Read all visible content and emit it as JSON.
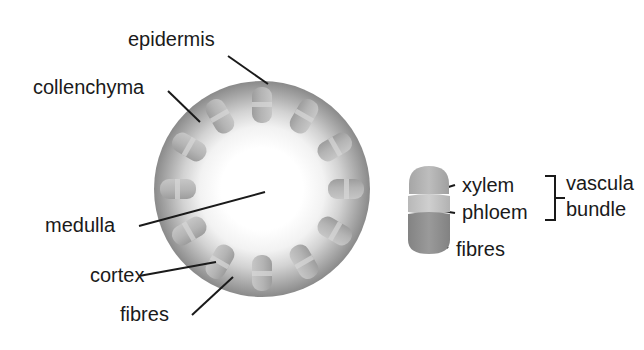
{
  "diagram": {
    "background_color": "#ffffff",
    "text_color": "#1a1a1a",
    "line_color": "#1a1a1a"
  },
  "stem": {
    "name": "stem-cross-section",
    "center_x": 262,
    "center_y": 189,
    "radius": 108,
    "rim_color": "#8a8a8a",
    "mid_color": "#bdbdbd",
    "core_color": "#ffffff",
    "bundle_count": 12,
    "bundle_ring_radius": 84,
    "bundle_color_outer": "#a9a9a9",
    "bundle_color_inner": "#c2c2c2",
    "bundles": [
      {
        "angle": -90,
        "label": "bundle-1"
      },
      {
        "angle": -60,
        "label": "bundle-2"
      },
      {
        "angle": -30,
        "label": "bundle-3"
      },
      {
        "angle": 0,
        "label": "bundle-4"
      },
      {
        "angle": 30,
        "label": "bundle-5"
      },
      {
        "angle": 60,
        "label": "bundle-6"
      },
      {
        "angle": 90,
        "label": "bundle-7"
      },
      {
        "angle": 120,
        "label": "bundle-8"
      },
      {
        "angle": 150,
        "label": "bundle-9"
      },
      {
        "angle": 180,
        "label": "bundle-10"
      },
      {
        "angle": 210,
        "label": "bundle-11"
      },
      {
        "angle": 240,
        "label": "bundle-12"
      }
    ]
  },
  "labels": {
    "epidermis": "epidermis",
    "collenchyma": "collenchyma",
    "medulla": "medulla",
    "cortex": "cortex",
    "fibres_stem": "fibres",
    "xylem": "xylem",
    "phloem": "phloem",
    "fibres_detail": "fibres",
    "vascular_line1": "vascula",
    "vascular_line2": "bundle"
  },
  "leader_lines": [
    {
      "name": "leader-epidermis",
      "x1": 228,
      "y1": 56,
      "x2": 268,
      "y2": 84
    },
    {
      "name": "leader-collenchyma",
      "x1": 168,
      "y1": 91,
      "x2": 200,
      "y2": 122
    },
    {
      "name": "leader-medulla",
      "x1": 139,
      "y1": 226,
      "x2": 265,
      "y2": 192
    },
    {
      "name": "leader-cortex",
      "x1": 139,
      "y1": 276,
      "x2": 216,
      "y2": 262
    },
    {
      "name": "leader-fibres-stem",
      "x1": 192,
      "y1": 315,
      "x2": 233,
      "y2": 277
    },
    {
      "name": "leader-xylem",
      "x1": 455,
      "y1": 185,
      "x2": 432,
      "y2": 192
    },
    {
      "name": "leader-phloem",
      "x1": 455,
      "y1": 213,
      "x2": 430,
      "y2": 209
    },
    {
      "name": "leader-fibres-detail",
      "x1": 448,
      "y1": 248,
      "x2": 428,
      "y2": 228
    }
  ],
  "vascular_bundle_detail": {
    "name": "vascular-bundle-detail",
    "x": 408,
    "y": 166,
    "width": 42,
    "height": 88,
    "segments": [
      {
        "name": "xylem-segment",
        "color": "#b5b5b5",
        "height_pct": 42
      },
      {
        "name": "phloem-segment",
        "color": "#c8c8c8",
        "height_pct": 20
      },
      {
        "name": "fibres-segment",
        "color": "#8f8f8f",
        "height_pct": 38
      }
    ]
  },
  "bracket": {
    "name": "vascular-bundle-bracket",
    "x": 545,
    "y_top": 176,
    "y_bottom": 220,
    "arm": 10,
    "tick": 10
  },
  "label_positions": {
    "epidermis": {
      "x": 128,
      "y": 28
    },
    "collenchyma": {
      "x": 33,
      "y": 76
    },
    "medulla": {
      "x": 45,
      "y": 214
    },
    "cortex": {
      "x": 90,
      "y": 264
    },
    "fibres_stem": {
      "x": 120,
      "y": 303
    },
    "xylem": {
      "x": 462,
      "y": 174
    },
    "phloem": {
      "x": 462,
      "y": 201
    },
    "fibres_detail": {
      "x": 456,
      "y": 238
    },
    "vascular": {
      "x": 566,
      "y": 172
    }
  }
}
